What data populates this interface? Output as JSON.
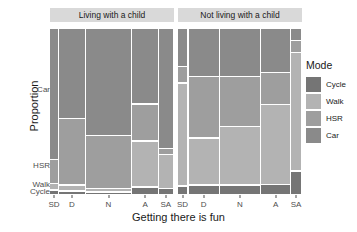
{
  "axes": {
    "y_title": "Proportion",
    "x_title": "Getting there is fun",
    "y_ticks": [
      {
        "label": "Car",
        "pos": 0.635
      },
      {
        "label": "HSR",
        "pos": 0.175
      },
      {
        "label": "Walk",
        "pos": 0.058
      },
      {
        "label": "Cycle",
        "pos": 0.018
      }
    ],
    "x_categories": [
      "SD",
      "D",
      "N",
      "A",
      "SA"
    ]
  },
  "legend": {
    "title": "Mode",
    "items": [
      {
        "label": "Cycle",
        "color": "#757575"
      },
      {
        "label": "Walk",
        "color": "#b3b3b3"
      },
      {
        "label": "HSR",
        "color": "#9e9e9e"
      },
      {
        "label": "Car",
        "color": "#8a8a8a"
      }
    ]
  },
  "panels": [
    {
      "title": "Living with a child"
    },
    {
      "title": "Not living with a child"
    }
  ],
  "chart_data": {
    "type": "bar",
    "subtype": "mosaic",
    "title": "",
    "xlabel": "Getting there is fun",
    "ylabel": "Proportion",
    "x_categories": [
      "SD",
      "D",
      "N",
      "A",
      "SA"
    ],
    "x_category_names": [
      "Strongly disagree",
      "Disagree",
      "Neutral",
      "Agree",
      "Strongly agree"
    ],
    "series_names": [
      "Cycle",
      "Walk",
      "HSR",
      "Car"
    ],
    "series_colors": [
      "#757575",
      "#b3b3b3",
      "#9e9e9e",
      "#8a8a8a"
    ],
    "ylim": [
      0,
      1
    ],
    "grid": false,
    "legend_position": "right",
    "facets": [
      {
        "name": "Living with a child",
        "column_widths": [
          0.075,
          0.215,
          0.375,
          0.215,
          0.12
        ],
        "columns": [
          {
            "category": "SD",
            "Car": 0.79,
            "HSR": 0.145,
            "Walk": 0.04,
            "Cycle": 0.025
          },
          {
            "category": "D",
            "Car": 0.545,
            "HSR": 0.4,
            "Walk": 0.035,
            "Cycle": 0.02
          },
          {
            "category": "N",
            "Car": 0.645,
            "HSR": 0.32,
            "Walk": 0.02,
            "Cycle": 0.015
          },
          {
            "category": "A",
            "Car": 0.455,
            "HSR": 0.225,
            "Walk": 0.275,
            "Cycle": 0.045
          },
          {
            "category": "SA",
            "Car": 0.725,
            "HSR": 0.035,
            "Walk": 0.205,
            "Cycle": 0.035
          }
        ]
      },
      {
        "name": "Not living with a child",
        "column_widths": [
          0.085,
          0.255,
          0.33,
          0.245,
          0.085
        ],
        "columns": [
          {
            "category": "SD",
            "Car": 0.23,
            "HSR": 0.1,
            "Walk": 0.62,
            "Cycle": 0.05
          },
          {
            "category": "D",
            "Car": 0.29,
            "HSR": 0.37,
            "Walk": 0.285,
            "Cycle": 0.055
          },
          {
            "category": "N",
            "Car": 0.29,
            "HSR": 0.3,
            "Walk": 0.355,
            "Cycle": 0.055
          },
          {
            "category": "A",
            "Car": 0.265,
            "HSR": 0.195,
            "Walk": 0.48,
            "Cycle": 0.06
          },
          {
            "category": "SA",
            "Car": 0.075,
            "HSR": 0.07,
            "Walk": 0.715,
            "Cycle": 0.14
          }
        ]
      }
    ]
  }
}
